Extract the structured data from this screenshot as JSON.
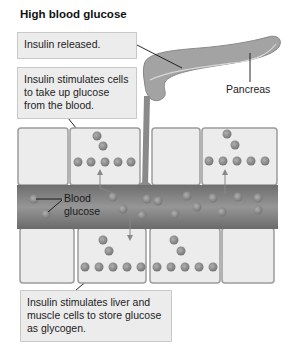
{
  "title": "High blood glucose",
  "boxes": {
    "insulin_released": "Insulin released.",
    "cells_uptake_lines": [
      "Insulin stimulates cells",
      "to take up glucose",
      "from the blood."
    ],
    "liver_muscle_lines": [
      "Insulin stimulates liver and",
      "muscle cells to store glucose",
      "as glycogen."
    ]
  },
  "labels": {
    "pancreas": "Pancreas",
    "blood_glucose_lines": [
      "Blood",
      "glucose"
    ]
  },
  "colors": {
    "organ": "#9a9a9a",
    "organ_light": "#b8b8b8",
    "vessel": "#7d7d7d",
    "cell_fill": "#ececec",
    "cell_border": "#9c9c9c",
    "glucose": "#8a8a8a",
    "box_fill": "#ececec"
  }
}
